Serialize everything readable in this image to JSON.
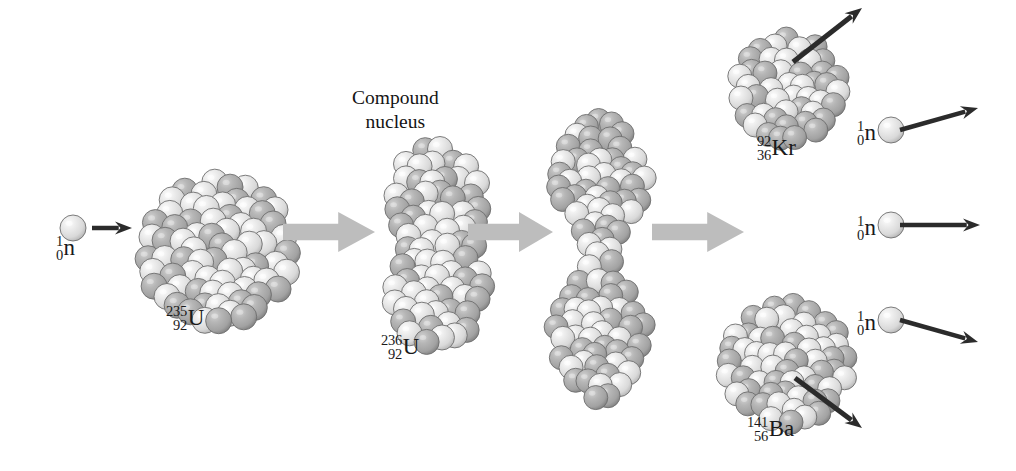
{
  "figure": {
    "background_color": "#ffffff",
    "width": 1016,
    "height": 471
  },
  "colors": {
    "proton_light": "#d9d9d9",
    "neutron_dark": "#a2a2a2",
    "sphere_outline": "#6e6e6e",
    "process_arrow": "#bdbdbd",
    "motion_arrow": "#2b2b2b",
    "text": "#1a1a1a"
  },
  "captions": [
    {
      "id": "compound-nucleus-caption",
      "line1": "Compound",
      "line2": "nucleus",
      "x": 352,
      "y": 86
    }
  ],
  "nuclide_labels": [
    {
      "id": "incoming-neutron-label",
      "mass": "1",
      "atomic": "0",
      "symbol": "n",
      "x": 56,
      "y": 232
    },
    {
      "id": "uranium-235-label",
      "mass": "235",
      "atomic": "92",
      "symbol": "U",
      "x": 166,
      "y": 302
    },
    {
      "id": "uranium-236-label",
      "mass": "236",
      "atomic": "92",
      "symbol": "U",
      "x": 381,
      "y": 331
    },
    {
      "id": "krypton-92-label",
      "mass": "92",
      "atomic": "36",
      "symbol": "Kr",
      "x": 757,
      "y": 132
    },
    {
      "id": "barium-141-label",
      "mass": "141",
      "atomic": "56",
      "symbol": "Ba",
      "x": 747,
      "y": 413
    },
    {
      "id": "emitted-neutron-1-label",
      "mass": "1",
      "atomic": "0",
      "symbol": "n",
      "x": 857,
      "y": 117
    },
    {
      "id": "emitted-neutron-2-label",
      "mass": "1",
      "atomic": "0",
      "symbol": "n",
      "x": 857,
      "y": 212
    },
    {
      "id": "emitted-neutron-3-label",
      "mass": "1",
      "atomic": "0",
      "symbol": "n",
      "x": 857,
      "y": 307
    }
  ],
  "process_arrows": [
    {
      "id": "process-arrow-1",
      "x": 283,
      "y": 212,
      "width": 92,
      "height": 40
    },
    {
      "id": "process-arrow-2",
      "x": 468,
      "y": 212,
      "width": 85,
      "height": 40
    },
    {
      "id": "process-arrow-3",
      "x": 652,
      "y": 212,
      "width": 92,
      "height": 40
    }
  ],
  "motion_arrows": [
    {
      "id": "incoming-neutron-arrow",
      "x1": 92,
      "y1": 228,
      "x2": 132,
      "y2": 228,
      "width": 4.5
    },
    {
      "id": "krypton-recoil-arrow",
      "x1": 793,
      "y1": 62,
      "x2": 862,
      "y2": 8,
      "width": 5
    },
    {
      "id": "barium-recoil-arrow",
      "x1": 795,
      "y1": 378,
      "x2": 862,
      "y2": 428,
      "width": 5
    },
    {
      "id": "emitted-neutron-1-arrow",
      "x1": 900,
      "y1": 130,
      "x2": 978,
      "y2": 108,
      "width": 4.5
    },
    {
      "id": "emitted-neutron-2-arrow",
      "x1": 900,
      "y1": 225,
      "x2": 980,
      "y2": 225,
      "width": 4.5
    },
    {
      "id": "emitted-neutron-3-arrow",
      "x1": 900,
      "y1": 320,
      "x2": 978,
      "y2": 342,
      "width": 4.5
    }
  ],
  "free_neutrons": [
    {
      "id": "incoming-neutron-sphere",
      "cx": 73,
      "cy": 228,
      "r": 13
    },
    {
      "id": "emitted-neutron-1-sphere",
      "cx": 891,
      "cy": 130,
      "r": 13
    },
    {
      "id": "emitted-neutron-2-sphere",
      "cx": 891,
      "cy": 225,
      "r": 13
    },
    {
      "id": "emitted-neutron-3-sphere",
      "cx": 891,
      "cy": 320,
      "r": 13
    }
  ],
  "nucleus_clusters": [
    {
      "id": "uranium-235-nucleus",
      "shape": "sphere",
      "x": 128,
      "y": 166,
      "width": 146,
      "height": 140,
      "nucleon_radius": 13,
      "nucleon_count": 78,
      "seed": 17
    },
    {
      "id": "uranium-236-compound-nucleus",
      "shape": "elongated",
      "x": 374,
      "y": 133,
      "width": 96,
      "height": 196,
      "nucleon_radius": 12.5,
      "nucleon_count": 84,
      "seed": 43
    },
    {
      "id": "scission-dumbbell-nucleus",
      "shape": "dumbbell",
      "x": 540,
      "y": 104,
      "width": 90,
      "height": 280,
      "nucleon_radius": 12,
      "nucleon_count": 92,
      "seed": 91
    },
    {
      "id": "krypton-92-fragment",
      "shape": "sphere",
      "x": 722,
      "y": 24,
      "width": 102,
      "height": 100,
      "nucleon_radius": 12,
      "nucleon_count": 46,
      "seed": 7
    },
    {
      "id": "barium-141-fragment",
      "shape": "sphere",
      "x": 712,
      "y": 290,
      "width": 120,
      "height": 118,
      "nucleon_radius": 12,
      "nucleon_count": 60,
      "seed": 59
    }
  ]
}
